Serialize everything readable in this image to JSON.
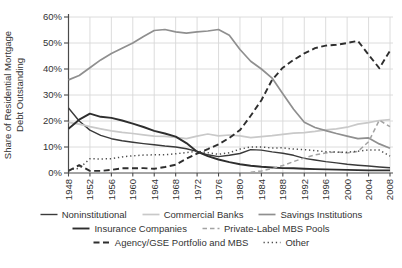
{
  "figure_name": "share-of-residential-mortgage-debt-outstanding",
  "chart_data": {
    "type": "line",
    "title": "",
    "ylabel": "Share of Residential Mortgage Debt Outstanding",
    "ylabel_lines": [
      "Share of Residential Mortgage",
      "Debt Outstanding"
    ],
    "xlim": [
      1948,
      2008
    ],
    "ylim": [
      0,
      60
    ],
    "grid": true,
    "legend_position": "bottom",
    "y_ticks": [
      0,
      10,
      20,
      30,
      40,
      50,
      60
    ],
    "y_tick_suffix": "%",
    "x_ticks": [
      1948,
      1952,
      1956,
      1960,
      1964,
      1968,
      1972,
      1976,
      1980,
      1984,
      1988,
      1992,
      1996,
      2000,
      2004,
      2008
    ],
    "x": [
      1948,
      1950,
      1952,
      1954,
      1956,
      1958,
      1960,
      1962,
      1964,
      1966,
      1968,
      1970,
      1972,
      1974,
      1976,
      1978,
      1980,
      1982,
      1984,
      1986,
      1988,
      1990,
      1992,
      1994,
      1996,
      1998,
      2000,
      2002,
      2004,
      2006,
      2008
    ],
    "series": [
      {
        "name": "Noninstitutional",
        "color": "#3a3a3a",
        "width": 1.4,
        "dash": null,
        "values": [
          25,
          20,
          16.5,
          14.5,
          13.2,
          12.4,
          11.8,
          11.3,
          10.9,
          10.4,
          10,
          9.3,
          8.3,
          7.0,
          6.3,
          6.8,
          7.5,
          9.0,
          8.8,
          8.1,
          7.6,
          6.8,
          5.6,
          5.0,
          4.4,
          3.9,
          3.4,
          3.0,
          2.7,
          2.3,
          2.0
        ]
      },
      {
        "name": "Commercial Banks",
        "color": "#c9c9c9",
        "width": 1.7,
        "dash": null,
        "values": [
          19.5,
          18.8,
          17.8,
          17.0,
          16.2,
          15.6,
          15.2,
          14.7,
          14.2,
          14.1,
          13.7,
          13.2,
          14.2,
          15.0,
          14.3,
          14.6,
          14.3,
          13.6,
          14.0,
          14.4,
          14.9,
          15.3,
          15.5,
          16.0,
          16.6,
          17.0,
          17.6,
          18.8,
          19.4,
          20.2,
          20.5
        ]
      },
      {
        "name": "Savings Institutions",
        "color": "#8f8f8f",
        "width": 1.7,
        "dash": null,
        "values": [
          35.8,
          37.5,
          40.5,
          43.5,
          46.0,
          48.0,
          50.0,
          52.5,
          54.8,
          55.2,
          54.3,
          53.8,
          54.3,
          54.6,
          55.2,
          53.0,
          47.5,
          43.0,
          40.0,
          36.5,
          30.5,
          24.5,
          19.5,
          17.5,
          16.3,
          15.2,
          14.2,
          13.2,
          13.5,
          11.2,
          9.5
        ]
      },
      {
        "name": "Insurance Companies",
        "color": "#2e2e2e",
        "width": 1.9,
        "dash": null,
        "values": [
          17.0,
          20.5,
          22.8,
          21.6,
          21.2,
          20.2,
          19.0,
          17.7,
          16.2,
          15.2,
          14.0,
          11.5,
          8.2,
          6.5,
          5.2,
          4.2,
          3.4,
          2.8,
          2.4,
          2.1,
          1.9,
          1.8,
          1.6,
          1.5,
          1.4,
          1.3,
          1.2,
          1.1,
          1.0,
          1.0,
          1.0
        ]
      },
      {
        "name": "Private-Label MBS Pools",
        "color": "#a3a3a3",
        "width": 1.5,
        "dash": "4.5,3",
        "values": [
          null,
          null,
          null,
          null,
          null,
          null,
          null,
          null,
          null,
          null,
          null,
          null,
          null,
          null,
          null,
          null,
          null,
          0.3,
          0.8,
          1.7,
          2.9,
          4.4,
          5.8,
          7.0,
          7.7,
          8.2,
          7.7,
          8.3,
          12.0,
          20.3,
          17.8
        ]
      },
      {
        "name": "Agency/GSE Portfolio and MBS",
        "color": "#2e2e2e",
        "width": 1.9,
        "dash": "6,3.5",
        "values": [
          0.8,
          3.0,
          0.8,
          0.8,
          1.2,
          1.8,
          1.8,
          1.9,
          1.6,
          2.3,
          3.2,
          5.5,
          7.5,
          9.2,
          11.0,
          13.5,
          16.5,
          22.0,
          28.0,
          35.8,
          40.5,
          43.5,
          46.0,
          48.0,
          49.0,
          49.3,
          50.0,
          50.8,
          45.5,
          40.3,
          47.0
        ]
      },
      {
        "name": "Other",
        "color": "#4d4d4d",
        "width": 1.5,
        "dash": "1.3,2.8",
        "values": [
          1.2,
          1.8,
          5.5,
          5.4,
          5.5,
          6.2,
          6.6,
          6.9,
          7.0,
          7.0,
          7.4,
          7.9,
          8.4,
          7.8,
          7.2,
          7.8,
          9.2,
          10.0,
          10.0,
          9.6,
          9.7,
          9.2,
          9.0,
          8.6,
          8.2,
          8.0,
          8.0,
          8.4,
          8.9,
          8.8,
          6.5
        ]
      }
    ],
    "legend_rows": [
      [
        0,
        1,
        2
      ],
      [
        3,
        4
      ],
      [
        5,
        6
      ]
    ]
  },
  "colors": {
    "grid": "#d8d8d8",
    "axis": "#4a4a4a",
    "text": "#333333",
    "background": "#ffffff"
  }
}
